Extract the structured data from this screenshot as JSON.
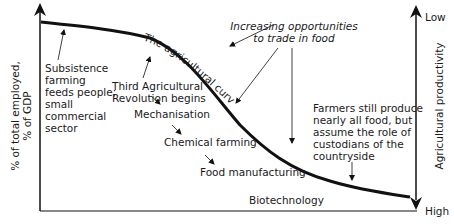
{
  "diagram": {
    "title": "The agricultural curve",
    "left_axis": {
      "label_line1": "% of total employed,",
      "label_line2": "% of GDP"
    },
    "right_axis": {
      "label": "Agricultural productivity",
      "top": "Low",
      "bottom": "High"
    },
    "curve_label": "The agricultural curve",
    "annotations": {
      "subsistence": [
        "Subsistence",
        "farming",
        "feeds people;",
        "small",
        "commercial",
        "sector"
      ],
      "trade": [
        "Increasing opportunities",
        "to trade in food"
      ],
      "third_revolution": [
        "Third Agricultural",
        "Revolution begins"
      ],
      "stages": [
        "Mechanisation",
        "Chemical farming",
        "Food manufacturing",
        "Biotechnology"
      ],
      "custodians": [
        "Farmers still produce",
        "nearly all food, but",
        "assume the role of",
        "custodians of the",
        "countryside"
      ]
    },
    "colors": {
      "line": "#111111",
      "text": "#1a1a1a",
      "background": "#ffffff"
    }
  }
}
